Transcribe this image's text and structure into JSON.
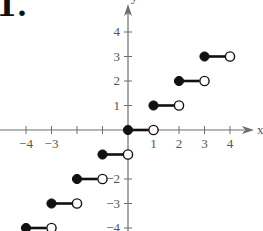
{
  "problem_number": "1.",
  "chart_data": {
    "type": "line",
    "subtype": "step",
    "title": "",
    "xlabel": "x",
    "ylabel": "y",
    "xlim": [
      -4.8,
      4.8
    ],
    "ylim": [
      -4,
      4.8
    ],
    "grid": false,
    "legend": null,
    "x_ticks": [
      -4,
      -3,
      -2,
      -1,
      1,
      2,
      3,
      4
    ],
    "x_tick_labels": [
      "−4",
      "−3",
      "",
      "",
      "1",
      "2",
      "3",
      "4"
    ],
    "y_ticks": [
      -4,
      -3,
      -2,
      -1,
      1,
      2,
      3,
      4
    ],
    "y_tick_labels": [
      "−4",
      "−3",
      "−2",
      "",
      "1",
      "2",
      "3",
      "4"
    ],
    "segments": [
      {
        "x_start": -5,
        "x_end": -4,
        "y": -5,
        "start": "closed",
        "end": "open"
      },
      {
        "x_start": -4,
        "x_end": -3,
        "y": -4,
        "start": "closed",
        "end": "open"
      },
      {
        "x_start": -3,
        "x_end": -2,
        "y": -3,
        "start": "closed",
        "end": "open"
      },
      {
        "x_start": -2,
        "x_end": -1,
        "y": -2,
        "start": "closed",
        "end": "open"
      },
      {
        "x_start": -1,
        "x_end": 0,
        "y": -1,
        "start": "closed",
        "end": "open"
      },
      {
        "x_start": 0,
        "x_end": 1,
        "y": 0,
        "start": "closed",
        "end": "open"
      },
      {
        "x_start": 1,
        "x_end": 2,
        "y": 1,
        "start": "closed",
        "end": "open"
      },
      {
        "x_start": 2,
        "x_end": 3,
        "y": 2,
        "start": "closed",
        "end": "open"
      },
      {
        "x_start": 3,
        "x_end": 4,
        "y": 3,
        "start": "closed",
        "end": "open"
      }
    ],
    "colors": {
      "axis": "#6e6e6e",
      "segment": "#111111",
      "label": "#555555"
    }
  }
}
